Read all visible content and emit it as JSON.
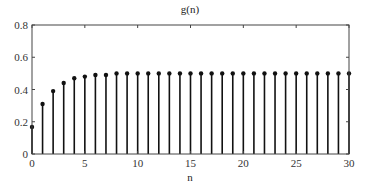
{
  "chart_data": {
    "type": "stem",
    "title": "g(n)",
    "xlabel": "n",
    "ylabel": "",
    "xlim": [
      0,
      30
    ],
    "ylim": [
      0,
      0.8
    ],
    "grid": false,
    "legend": null,
    "xticks": [
      0,
      5,
      10,
      15,
      20,
      25,
      30
    ],
    "xtick_labels": [
      "0",
      "5",
      "10",
      "15",
      "20",
      "25",
      "30"
    ],
    "yticks": [
      0,
      0.2,
      0.4,
      0.6,
      0.8
    ],
    "ytick_labels": [
      "0",
      "0.2",
      "0.4",
      "0.6",
      "0.8"
    ],
    "x": [
      0,
      1,
      2,
      3,
      4,
      5,
      6,
      7,
      8,
      9,
      10,
      11,
      12,
      13,
      14,
      15,
      16,
      17,
      18,
      19,
      20,
      21,
      22,
      23,
      24,
      25,
      26,
      27,
      28,
      29,
      30
    ],
    "values": [
      0.167,
      0.31,
      0.39,
      0.44,
      0.47,
      0.48,
      0.49,
      0.49,
      0.5,
      0.5,
      0.5,
      0.5,
      0.5,
      0.5,
      0.5,
      0.5,
      0.5,
      0.5,
      0.5,
      0.5,
      0.5,
      0.5,
      0.5,
      0.5,
      0.5,
      0.5,
      0.5,
      0.5,
      0.5,
      0.5,
      0.5
    ],
    "colors": {
      "stem": "#111111",
      "axes": "#444444",
      "background": "#ffffff"
    }
  }
}
